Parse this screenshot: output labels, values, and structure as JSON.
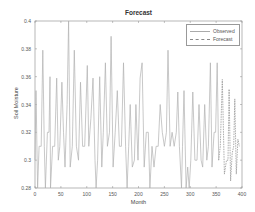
{
  "chart_data": {
    "type": "line",
    "title": "Forecast",
    "xlabel": "Month",
    "ylabel": "Soil Moisture",
    "xlim": [
      0,
      400
    ],
    "ylim": [
      0.28,
      0.4
    ],
    "xticks": [
      0,
      50,
      100,
      150,
      200,
      250,
      300,
      350,
      400
    ],
    "yticks": [
      0.28,
      0.3,
      0.32,
      0.34,
      0.36,
      0.38,
      0.4
    ],
    "grid": false,
    "legend_position": "upper right",
    "legend": [
      "Observed",
      "Forecast"
    ],
    "series": [
      {
        "name": "Observed",
        "color": "#b0b0b0",
        "style": "solid",
        "x": [
          0,
          2,
          5,
          8,
          12,
          15,
          18,
          20,
          24,
          27,
          29,
          30,
          34,
          38,
          42,
          45,
          48,
          52,
          55,
          58,
          62,
          65,
          68,
          72,
          76,
          80,
          84,
          88,
          92,
          96,
          101,
          104,
          108,
          112,
          116,
          118,
          121,
          125,
          129,
          132,
          136,
          140,
          144,
          147,
          151,
          155,
          159,
          163,
          167,
          171,
          175,
          178,
          181,
          184,
          188,
          192,
          195,
          199,
          203,
          207,
          211,
          215,
          219,
          222,
          226,
          230,
          234,
          238,
          242,
          246,
          250,
          254,
          257,
          261,
          265,
          269,
          273,
          276,
          279,
          283,
          285,
          288,
          292,
          295,
          298,
          301,
          305,
          309,
          313,
          317,
          321,
          324,
          328,
          332,
          335,
          339,
          342,
          346,
          349,
          352,
          355
        ],
        "y": [
          0.3,
          0.35,
          0.28,
          0.31,
          0.31,
          0.379,
          0.31,
          0.28,
          0.32,
          0.32,
          0.36,
          0.28,
          0.31,
          0.31,
          0.359,
          0.3,
          0.31,
          0.356,
          0.32,
          0.295,
          0.34,
          0.4,
          0.295,
          0.31,
          0.379,
          0.31,
          0.3,
          0.356,
          0.31,
          0.31,
          0.368,
          0.31,
          0.33,
          0.359,
          0.3,
          0.28,
          0.3,
          0.36,
          0.295,
          0.32,
          0.37,
          0.31,
          0.32,
          0.389,
          0.295,
          0.32,
          0.35,
          0.31,
          0.31,
          0.37,
          0.31,
          0.28,
          0.31,
          0.34,
          0.295,
          0.3,
          0.34,
          0.3,
          0.359,
          0.37,
          0.295,
          0.32,
          0.32,
          0.28,
          0.31,
          0.295,
          0.31,
          0.31,
          0.34,
          0.32,
          0.31,
          0.32,
          0.379,
          0.31,
          0.32,
          0.31,
          0.32,
          0.349,
          0.31,
          0.28,
          0.31,
          0.35,
          0.28,
          0.295,
          0.28,
          0.3,
          0.349,
          0.3,
          0.3,
          0.34,
          0.3,
          0.295,
          0.34,
          0.3,
          0.31,
          0.37,
          0.295,
          0.32,
          0.32,
          0.37,
          0.3
        ]
      },
      {
        "name": "Forecast",
        "color": "#888888",
        "style": "dashed",
        "x": [
          355,
          358,
          362,
          366,
          370,
          373,
          375,
          378,
          381,
          384,
          386,
          389,
          392,
          395
        ],
        "y": [
          0.3,
          0.31,
          0.358,
          0.29,
          0.3,
          0.3,
          0.351,
          0.285,
          0.305,
          0.31,
          0.344,
          0.29,
          0.315,
          0.31
        ]
      }
    ]
  }
}
